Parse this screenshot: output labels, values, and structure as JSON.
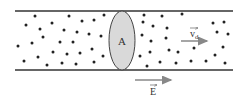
{
  "diagram": {
    "cross_section_label": "A",
    "drift_velocity_label": "v",
    "drift_velocity_subscript": "d",
    "field_label": "E",
    "colors": {
      "wire_lines": "#333333",
      "charges": "#222222",
      "cross_section_fill": "#d9d9d9",
      "arrows": "#888888"
    },
    "charges_left": [
      [
        35,
        16
      ],
      [
        69,
        16
      ],
      [
        104,
        15
      ],
      [
        26,
        25
      ],
      [
        52,
        23
      ],
      [
        82,
        21
      ],
      [
        94,
        20
      ],
      [
        40,
        29
      ],
      [
        64,
        30
      ],
      [
        77,
        32
      ],
      [
        89,
        34
      ],
      [
        101,
        36
      ],
      [
        43,
        37
      ],
      [
        18,
        46
      ],
      [
        32,
        43
      ],
      [
        60,
        42
      ],
      [
        73,
        42
      ],
      [
        92,
        49
      ],
      [
        24,
        61
      ],
      [
        38,
        57
      ],
      [
        53,
        52
      ],
      [
        67,
        54
      ],
      [
        80,
        53
      ],
      [
        103,
        56
      ],
      [
        47,
        65
      ],
      [
        62,
        63
      ],
      [
        76,
        64
      ],
      [
        94,
        62
      ]
    ],
    "charges_right": [
      [
        144,
        15
      ],
      [
        182,
        14
      ],
      [
        162,
        16
      ],
      [
        143,
        22
      ],
      [
        153,
        26
      ],
      [
        167,
        28
      ],
      [
        213,
        23
      ],
      [
        224,
        22
      ],
      [
        142,
        35
      ],
      [
        151,
        41
      ],
      [
        166,
        38
      ],
      [
        217,
        32
      ],
      [
        228,
        34
      ],
      [
        140,
        56
      ],
      [
        150,
        52
      ],
      [
        169,
        50
      ],
      [
        178,
        52
      ],
      [
        194,
        48
      ],
      [
        223,
        47
      ],
      [
        147,
        66
      ],
      [
        160,
        62
      ],
      [
        176,
        63
      ],
      [
        191,
        61
      ],
      [
        206,
        61
      ],
      [
        215,
        55
      ],
      [
        225,
        63
      ]
    ]
  }
}
